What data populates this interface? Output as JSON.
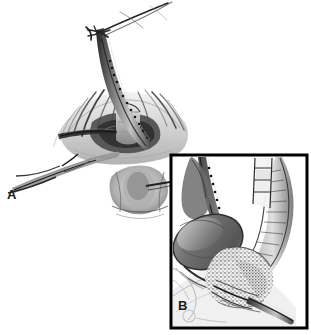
{
  "figure": {
    "medium": "grayscale pen-and-ink / graphite medical illustration",
    "background_color": "#ffffff",
    "ink_color": "#1b1b1b",
    "midtone_color": "#777777",
    "light_tone_color": "#c9c9c9"
  },
  "panels": [
    {
      "id": "A",
      "label": "A",
      "framed": false,
      "caption": "",
      "description": "Open operative field: retracted wound edges with radiating fascial strokes, a sutured tube exiting superiorly, tied suture knot above, a retractor entering from lower left, and an anatomical structure at bottom center.",
      "bounds": {
        "x": 0,
        "y": 0,
        "width": 200,
        "height": 230
      },
      "elements": [
        {
          "name": "suture-knot",
          "description": "crossed tied suture strands at top"
        },
        {
          "name": "drain-tube",
          "description": "tube with dotted running suture line"
        },
        {
          "name": "wound-retraction",
          "description": "retracted tissue edges with radiating strokes"
        },
        {
          "name": "retractor-instrument",
          "description": "instrument entering from lower left"
        },
        {
          "name": "anatomical-structure",
          "description": "tissue structure at bottom center"
        }
      ]
    },
    {
      "id": "B",
      "label": "B",
      "framed": true,
      "caption": "",
      "description": "Framed magnified inset: oval organ (gallbladder) at left, sutured duct with clips running vertically, stippled textured tissue at right, and a small drain tube at lower right.",
      "frame": {
        "x": 171,
        "y": 155,
        "width": 136,
        "height": 173,
        "border_color": "#000000",
        "border_width": 3
      },
      "elements": [
        {
          "name": "oval-organ",
          "description": "shaded oval organ, gallbladder-like"
        },
        {
          "name": "sutured-duct",
          "description": "vertical duct with running suture dots and metal clips"
        },
        {
          "name": "stippled-tissue",
          "description": "granular stippled tissue mass, pancreatic/duodenal"
        },
        {
          "name": "drain-tube-inset",
          "description": "small cylindrical drain exiting lower right"
        }
      ]
    }
  ],
  "signature": {
    "text": "",
    "visible": true,
    "note": "faint illegible artist mark below frame"
  }
}
